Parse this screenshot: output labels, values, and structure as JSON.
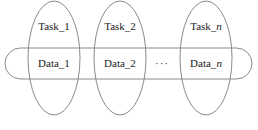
{
  "diagram": {
    "type": "overlapping-ellipses-over-capsule",
    "background_color": "#ffffff",
    "stroke_color": "#8a8a8a",
    "text_color": "#1a1a1a",
    "capsule": {
      "name": "shared-data-capsule",
      "x": 5,
      "y": 48,
      "width": 247,
      "height": 31
    },
    "ellipsis": {
      "glyph": "···",
      "x": 162,
      "y": 63
    },
    "groups": [
      {
        "id": "group-1",
        "task_label": "Task_1",
        "task_suffix": "1",
        "task_suffix_italic": false,
        "data_label": "Data_1",
        "data_suffix": "1",
        "data_suffix_italic": false,
        "cx": 54,
        "cy": 58,
        "rx": 26,
        "ry": 57,
        "task_y": 20,
        "data_y": 57
      },
      {
        "id": "group-2",
        "task_label": "Task_2",
        "task_suffix": "2",
        "task_suffix_italic": false,
        "data_label": "Data_2",
        "data_suffix": "2",
        "data_suffix_italic": false,
        "cx": 120,
        "cy": 58,
        "rx": 26,
        "ry": 57,
        "task_y": 20,
        "data_y": 57
      },
      {
        "id": "group-n",
        "task_label": "Task_n",
        "task_suffix": "n",
        "task_suffix_italic": true,
        "data_label": "Data_n",
        "data_suffix": "n",
        "data_suffix_italic": true,
        "cx": 206,
        "cy": 58,
        "rx": 26,
        "ry": 57,
        "task_y": 20,
        "data_y": 57
      }
    ]
  }
}
